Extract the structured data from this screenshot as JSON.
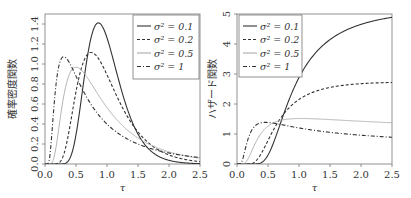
{
  "chart_data": [
    {
      "type": "line",
      "title": "",
      "xlabel": "τ",
      "ylabel": "確率密度関数",
      "xlim": [
        0,
        2.5
      ],
      "ylim": [
        0,
        1.45
      ],
      "xticks": [
        "0.0",
        "0.5",
        "1.0",
        "1.5",
        "2.0",
        "2.5"
      ],
      "yticks": [
        "0.0",
        "0.2",
        "0.4",
        "0.6",
        "0.8",
        "1.0",
        "1.2",
        "1.4"
      ],
      "grid": false,
      "legend_position": "top-right",
      "function": "density",
      "series": [
        {
          "name": "σ² = 0.1",
          "sigma2": 0.1,
          "style": "solid",
          "color": "#333333",
          "peak": {
            "x": 0.9,
            "y": 1.32
          }
        },
        {
          "name": "σ² = 0.2",
          "sigma2": 0.2,
          "style": "dashed",
          "color": "#333333",
          "peak": {
            "x": 0.8,
            "y": 0.98
          }
        },
        {
          "name": "σ² = 0.5",
          "sigma2": 0.5,
          "style": "solid",
          "color": "#aaaaaa",
          "peak": {
            "x": 0.6,
            "y": 0.72
          }
        },
        {
          "name": "σ² = 1",
          "sigma2": 1,
          "style": "dashdot",
          "color": "#333333",
          "peak": {
            "x": 0.38,
            "y": 0.65
          }
        }
      ]
    },
    {
      "type": "line",
      "title": "",
      "xlabel": "τ",
      "ylabel": "ハザード関数",
      "xlim": [
        0,
        2.5
      ],
      "ylim": [
        0,
        5
      ],
      "xticks": [
        "0.0",
        "0.5",
        "1.0",
        "1.5",
        "2.0",
        "2.5"
      ],
      "yticks": [
        "0",
        "1",
        "2",
        "3",
        "4",
        "5"
      ],
      "grid": false,
      "legend_position": "top-left",
      "function": "hazard",
      "series": [
        {
          "name": "σ² = 0.1",
          "sigma2": 0.1,
          "style": "solid",
          "color": "#333333",
          "end_value": 4.05
        },
        {
          "name": "σ² = 0.2",
          "sigma2": 0.2,
          "style": "dashed",
          "color": "#333333",
          "end_value": 2.15
        },
        {
          "name": "σ² = 0.5",
          "sigma2": 0.5,
          "style": "solid",
          "color": "#aaaaaa",
          "end_value": 1.0
        },
        {
          "name": "σ² = 1",
          "sigma2": 1,
          "style": "dashdot",
          "color": "#333333",
          "end_value": 0.6
        }
      ]
    }
  ]
}
